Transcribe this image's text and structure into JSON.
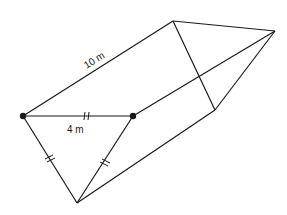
{
  "diagram": {
    "type": "triangular-prism",
    "labels": {
      "length": "10 m",
      "side": "4 m"
    },
    "colors": {
      "line": "#1a1a1a",
      "background": "#ffffff"
    },
    "vertices": {
      "A": [
        23,
        116
      ],
      "B": [
        133,
        116
      ],
      "C": [
        77,
        203
      ],
      "D": [
        173,
        21
      ],
      "E": [
        275,
        31
      ],
      "F": [
        215,
        110
      ]
    }
  }
}
